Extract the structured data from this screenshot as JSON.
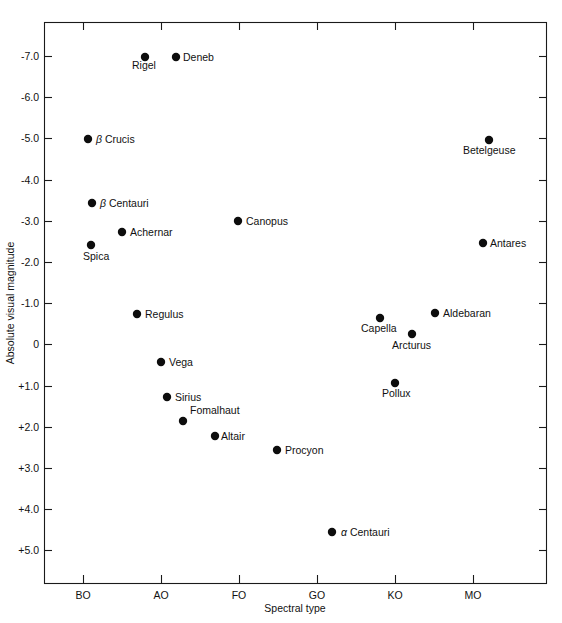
{
  "chart_data": {
    "type": "scatter",
    "title": "",
    "xlabel": "Spectral type",
    "ylabel": "Absolute visual magnitude",
    "grid": false,
    "legend": "none",
    "xticklabels": [
      "BO",
      "AO",
      "FO",
      "GO",
      "KO",
      "MO"
    ],
    "yticklabels": [
      "-7.0",
      "-6.0",
      "-5.0",
      "-4.0",
      "-3.0",
      "-2.0",
      "-1.0",
      "0",
      "+1.0",
      "+2.0",
      "+3.0",
      "+4.0",
      "+5.0"
    ],
    "yvalues": [
      -7.0,
      -6.0,
      -5.0,
      -4.0,
      -3.0,
      -2.0,
      -1.0,
      0,
      1.0,
      2.0,
      3.0,
      4.0,
      5.0
    ],
    "ylim": [
      -7.8,
      5.8
    ],
    "yaxis_inverted": true,
    "points": [
      {
        "name": "Rigel",
        "x": 145,
        "y": 57,
        "spectral": "B8",
        "magnitude": -7.0,
        "label_dx": -13,
        "label_dy": 12,
        "anchor": "start"
      },
      {
        "name": "Deneb",
        "x": 176,
        "y": 57,
        "spectral": "A2",
        "magnitude": -7.0,
        "label_dx": 7,
        "label_dy": 4,
        "anchor": "start"
      },
      {
        "name": "β Crucis",
        "x": 88,
        "y": 139,
        "spectral": "B0",
        "magnitude": -5.0,
        "label_dx": 8,
        "label_dy": 4,
        "anchor": "start",
        "greek": true
      },
      {
        "name": "Betelgeuse",
        "x": 489,
        "y": 140,
        "spectral": "M2",
        "magnitude": -5.0,
        "label_dx": -26,
        "label_dy": 14,
        "anchor": "start"
      },
      {
        "name": "β Centauri",
        "x": 92,
        "y": 203,
        "spectral": "B1",
        "magnitude": -3.4,
        "label_dx": 8,
        "label_dy": 4,
        "anchor": "start",
        "greek": true
      },
      {
        "name": "Canopus",
        "x": 238,
        "y": 221,
        "spectral": "FO",
        "magnitude": -3.0,
        "label_dx": 8,
        "label_dy": 4,
        "anchor": "start"
      },
      {
        "name": "Achernar",
        "x": 122,
        "y": 232,
        "spectral": "B5",
        "magnitude": -2.7,
        "label_dx": 8,
        "label_dy": 4,
        "anchor": "start"
      },
      {
        "name": "Spica",
        "x": 91,
        "y": 245,
        "spectral": "B1",
        "magnitude": -2.4,
        "label_dx": -8,
        "label_dy": 15,
        "anchor": "start"
      },
      {
        "name": "Antares",
        "x": 483,
        "y": 243,
        "spectral": "M1",
        "magnitude": -2.4,
        "label_dx": 7,
        "label_dy": 4,
        "anchor": "start"
      },
      {
        "name": "Regulus",
        "x": 137,
        "y": 314,
        "spectral": "B7",
        "magnitude": -0.7,
        "label_dx": 8,
        "label_dy": 4,
        "anchor": "start"
      },
      {
        "name": "Aldebaran",
        "x": 435,
        "y": 313,
        "spectral": "K5",
        "magnitude": -0.7,
        "label_dx": 8,
        "label_dy": 4,
        "anchor": "start"
      },
      {
        "name": "Capella",
        "x": 380,
        "y": 318,
        "spectral": "G8",
        "magnitude": -0.6,
        "label_dx": -19,
        "label_dy": 14,
        "anchor": "start"
      },
      {
        "name": "Arcturus",
        "x": 412,
        "y": 334,
        "spectral": "K2",
        "magnitude": -0.2,
        "label_dx": -20,
        "label_dy": 15,
        "anchor": "start"
      },
      {
        "name": "Vega",
        "x": 161,
        "y": 362,
        "spectral": "AO",
        "magnitude": 0.5,
        "label_dx": 8,
        "label_dy": 4,
        "anchor": "start"
      },
      {
        "name": "Pollux",
        "x": 395,
        "y": 383,
        "spectral": "K0",
        "magnitude": 1.0,
        "label_dx": -13,
        "label_dy": 14,
        "anchor": "start"
      },
      {
        "name": "Sirius",
        "x": 167,
        "y": 397,
        "spectral": "A1",
        "magnitude": 1.4,
        "label_dx": 8,
        "label_dy": 4,
        "anchor": "start"
      },
      {
        "name": "Fomalhaut",
        "x": 183,
        "y": 421,
        "spectral": "A3",
        "magnitude": 2.0,
        "label_dx": 7,
        "label_dy": -7,
        "anchor": "start"
      },
      {
        "name": "Altair",
        "x": 215,
        "y": 436,
        "spectral": "A7",
        "magnitude": 2.3,
        "label_dx": 6,
        "label_dy": 4,
        "anchor": "start"
      },
      {
        "name": "Procyon",
        "x": 277,
        "y": 450,
        "spectral": "F5",
        "magnitude": 2.7,
        "label_dx": 8,
        "label_dy": 4,
        "anchor": "start"
      },
      {
        "name": "α Centauri",
        "x": 332,
        "y": 532,
        "spectral": "G2",
        "magnitude": 4.8,
        "label_dx": 9,
        "label_dy": 4,
        "anchor": "start",
        "greek": true
      }
    ],
    "xtick_positions": [
      83,
      161,
      239,
      317,
      395,
      473
    ],
    "ytick_positions": [
      56,
      97,
      138,
      180,
      221,
      262,
      303,
      344,
      386,
      427,
      468,
      509,
      550
    ],
    "plot_frame": {
      "left": 44,
      "right": 547,
      "top": 22,
      "bottom": 583
    }
  }
}
